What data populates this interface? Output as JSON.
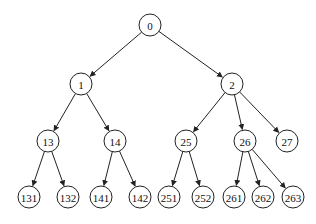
{
  "diagram": {
    "type": "tree",
    "node_radius": 11,
    "nodes": [
      {
        "id": "0",
        "label": "0",
        "x": 150,
        "y": 25
      },
      {
        "id": "1",
        "label": "1",
        "x": 81,
        "y": 84
      },
      {
        "id": "2",
        "label": "2",
        "x": 232,
        "y": 84
      },
      {
        "id": "13",
        "label": "13",
        "x": 48,
        "y": 141
      },
      {
        "id": "14",
        "label": "14",
        "x": 115,
        "y": 141
      },
      {
        "id": "25",
        "label": "25",
        "x": 186,
        "y": 141
      },
      {
        "id": "26",
        "label": "26",
        "x": 245,
        "y": 141
      },
      {
        "id": "27",
        "label": "27",
        "x": 287,
        "y": 141
      },
      {
        "id": "131",
        "label": "131",
        "x": 29,
        "y": 197
      },
      {
        "id": "132",
        "label": "132",
        "x": 68,
        "y": 197
      },
      {
        "id": "141",
        "label": "141",
        "x": 101,
        "y": 197
      },
      {
        "id": "142",
        "label": "142",
        "x": 140,
        "y": 197
      },
      {
        "id": "251",
        "label": "251",
        "x": 169,
        "y": 197
      },
      {
        "id": "252",
        "label": "252",
        "x": 203,
        "y": 197
      },
      {
        "id": "261",
        "label": "261",
        "x": 234,
        "y": 197
      },
      {
        "id": "262",
        "label": "262",
        "x": 263,
        "y": 197
      },
      {
        "id": "263",
        "label": "263",
        "x": 293,
        "y": 197
      }
    ],
    "edges": [
      [
        "0",
        "1"
      ],
      [
        "0",
        "2"
      ],
      [
        "1",
        "13"
      ],
      [
        "1",
        "14"
      ],
      [
        "2",
        "25"
      ],
      [
        "2",
        "26"
      ],
      [
        "2",
        "27"
      ],
      [
        "13",
        "131"
      ],
      [
        "13",
        "132"
      ],
      [
        "14",
        "141"
      ],
      [
        "14",
        "142"
      ],
      [
        "25",
        "251"
      ],
      [
        "25",
        "252"
      ],
      [
        "26",
        "261"
      ],
      [
        "26",
        "262"
      ],
      [
        "26",
        "263"
      ]
    ]
  }
}
